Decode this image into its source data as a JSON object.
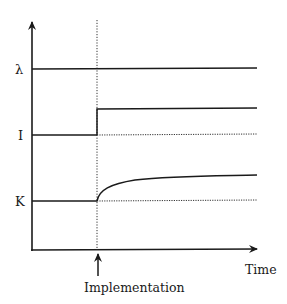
{
  "diagram": {
    "y_axis_labels": [
      {
        "id": "lambda",
        "text": "λ",
        "y": 69
      },
      {
        "id": "I",
        "text": "I",
        "y": 135
      },
      {
        "id": "K",
        "text": "K",
        "y": 201
      }
    ],
    "x_axis_label": "Time",
    "event_label": "Implementation",
    "colors": {
      "line": "#1a1a1a",
      "background": "#ffffff"
    }
  }
}
